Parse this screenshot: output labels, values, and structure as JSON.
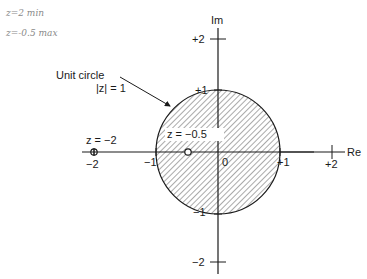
{
  "handwritten_notes": [
    "z=2  min",
    "z=-0.5 max"
  ],
  "diagram": {
    "axes": {
      "real_label": "Re",
      "imag_label": "Im",
      "real_ticks": [
        "−2",
        "−1",
        "0",
        "+1",
        "+2"
      ],
      "imag_ticks": [
        "+2",
        "+1",
        "−1",
        "−2"
      ]
    },
    "unit_circle": {
      "label_line1": "Unit circle",
      "label_line2": "|z| = 1",
      "fill": "hatched"
    },
    "points": [
      {
        "label": "z = −2",
        "re": -2,
        "im": 0
      },
      {
        "label": "z = −0.5",
        "re": -0.5,
        "im": 0
      }
    ],
    "colors": {
      "ink": "#1a1a1a",
      "hatch": "#555555",
      "handwriting": "#8a8a8a"
    }
  }
}
